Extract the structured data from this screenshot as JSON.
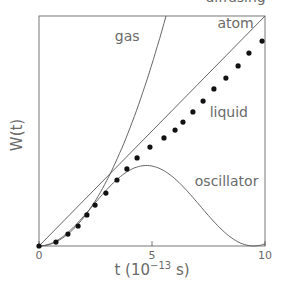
{
  "chart_data": {
    "type": "line",
    "title": "",
    "xlabel": "t (10^-13 s)",
    "xlabel_parts": {
      "base": "t  (10",
      "exp": "−13",
      "unit": " s)"
    },
    "ylabel": "W(t)",
    "xlim": [
      0,
      10
    ],
    "ylim": [
      0,
      10
    ],
    "xticks": [
      0,
      5,
      10
    ],
    "xtick_labels": [
      "0",
      "5",
      "10"
    ],
    "yticks": [],
    "grid": false,
    "legend": "inline labels",
    "series": [
      {
        "name": "gas",
        "kind": "line",
        "description": "parabolic (ballistic) W ∝ t²",
        "x": [
          0,
          1,
          2,
          3,
          4,
          5,
          5.62
        ],
        "y": [
          0,
          0.32,
          1.29,
          2.91,
          5.17,
          8.08,
          10.0
        ]
      },
      {
        "name": "diffusing atom",
        "kind": "line",
        "description": "straight line W ∝ t",
        "x": [
          0,
          10
        ],
        "y": [
          0,
          10
        ]
      },
      {
        "name": "oscillator",
        "kind": "line",
        "description": "W ∝ 1 − cos(ωt), peak near t≈4.9, returns to ~0 near t≈9.4",
        "x": [
          0,
          1,
          2,
          3,
          4,
          4.9,
          6,
          7,
          8,
          9,
          9.4,
          10
        ],
        "y": [
          0,
          0.4,
          1.3,
          2.4,
          3.3,
          3.5,
          3.1,
          2.2,
          1.0,
          0.15,
          0.0,
          0.2
        ]
      },
      {
        "name": "liquid",
        "kind": "scatter",
        "x": [
          0,
          0.75,
          1.28,
          1.73,
          2.12,
          2.48,
          2.96,
          3.45,
          3.89,
          4.34,
          4.91,
          5.53,
          6.02,
          6.37,
          6.81,
          7.26,
          7.74,
          8.27,
          8.81,
          9.29,
          9.87
        ],
        "y": [
          0,
          0.17,
          0.52,
          0.87,
          1.35,
          1.78,
          2.3,
          2.87,
          3.35,
          3.83,
          4.3,
          4.7,
          5.04,
          5.39,
          5.83,
          6.3,
          6.83,
          7.3,
          7.83,
          8.39,
          8.91
        ]
      }
    ],
    "annotations": [
      {
        "text": "gas",
        "x": 3.9,
        "y": 8.9
      },
      {
        "text": "diffusing",
        "x": 8.7,
        "y": 10.6
      },
      {
        "text": "atom",
        "x": 8.7,
        "y": 9.5
      },
      {
        "text": "liquid",
        "x": 8.4,
        "y": 5.6
      },
      {
        "text": "oscillator",
        "x": 8.3,
        "y": 2.6
      }
    ],
    "colors": {
      "lines": "#555555",
      "markers": "#111111",
      "text": "#6a6a6a",
      "frame": "#555555"
    }
  }
}
